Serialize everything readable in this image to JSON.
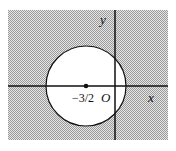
{
  "diagram": {
    "labels": {
      "y_axis": "y",
      "x_axis": "x",
      "origin": "O",
      "center": "−3/2"
    },
    "colors": {
      "shading": "#b8b8b8",
      "stroke": "#111111",
      "circle_fill": "#ffffff"
    }
  }
}
